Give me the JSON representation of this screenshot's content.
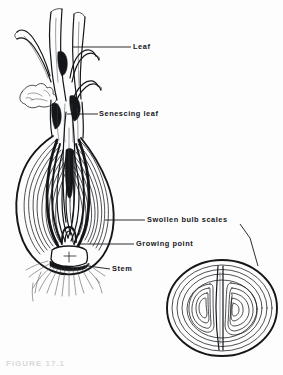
{
  "figure": {
    "caption": "FIGURE 17.1",
    "background_color": "#fdfdfd",
    "ink_color": "#14161a"
  },
  "labels": [
    {
      "id": "leaf",
      "text": "Leaf"
    },
    {
      "id": "senescing-leaf",
      "text": "Senescing  leaf"
    },
    {
      "id": "swollen-bulb-scales",
      "text": "Swollen  bulb  scales"
    },
    {
      "id": "growing-point",
      "text": "Growing  point"
    },
    {
      "id": "stem",
      "text": "Stem"
    }
  ],
  "parts": {
    "longitudinal_section": "onion-bulb-longitudinal-section",
    "cross_section": "onion-bulb-cross-section",
    "roots": "root-hairs",
    "foliage": "foliage-leaves"
  }
}
